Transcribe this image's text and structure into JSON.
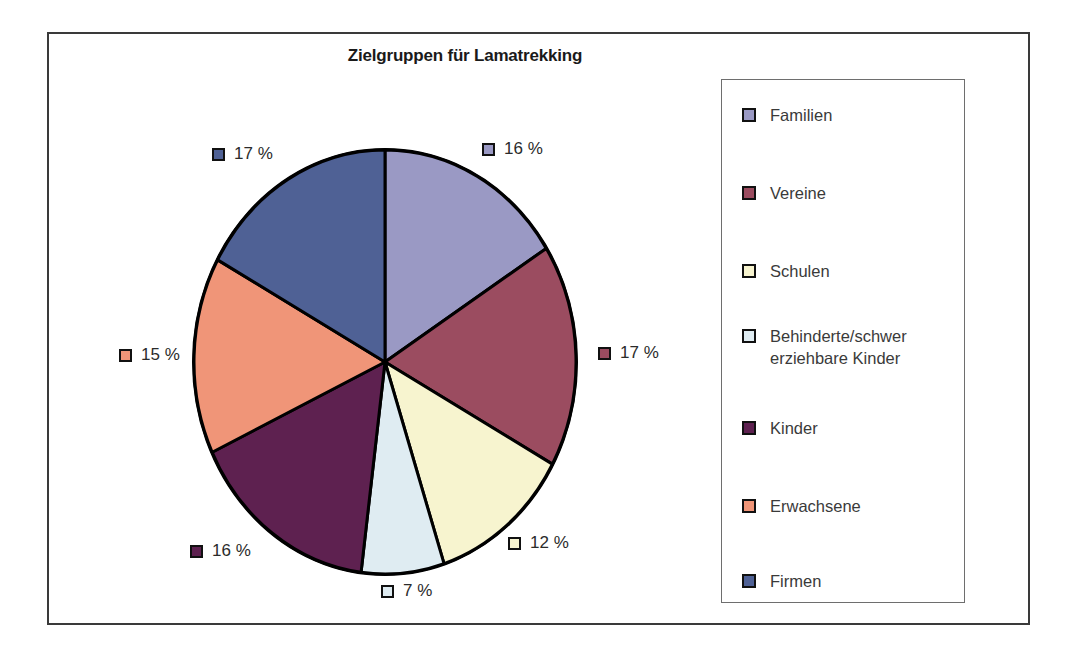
{
  "chart_data": {
    "type": "pie",
    "title": "Zielgruppen für Lamatrekking",
    "categories": [
      "Familien",
      "Vereine",
      "Schulen",
      "Behinderte/schwer erziehbare Kinder",
      "Kinder",
      "Erwachsene",
      "Firmen"
    ],
    "values": [
      16,
      17,
      12,
      7,
      16,
      15,
      17
    ],
    "value_labels": [
      "16 %",
      "17 %",
      "12 %",
      "7 %",
      "16 %",
      "15 %",
      "17 %"
    ],
    "unit": "%",
    "colors": [
      "#9a99c4",
      "#9b4c60",
      "#f7f4cf",
      "#dfecf2",
      "#5e2150",
      "#f09578",
      "#4f6195"
    ],
    "legend_position": "right",
    "start_angle_deg": 0,
    "direction": "clockwise",
    "grid": false,
    "xlabel": "",
    "ylabel": ""
  },
  "title": {
    "text": "Zielgruppen für Lamatrekking"
  },
  "legend": {
    "items": [
      {
        "label": "Familien",
        "color": "#9a99c4"
      },
      {
        "label": "Vereine",
        "color": "#9b4c60"
      },
      {
        "label": "Schulen",
        "color": "#f7f4cf"
      },
      {
        "label": "Behinderte/schwer\nerziehbare Kinder",
        "color": "#dfecf2"
      },
      {
        "label": "Kinder",
        "color": "#5e2150"
      },
      {
        "label": "Erwachsene",
        "color": "#f09578"
      },
      {
        "label": "Firmen",
        "color": "#4f6195"
      }
    ]
  },
  "pie_labels": [
    {
      "text": "16 %",
      "color": "#9a99c4"
    },
    {
      "text": "17 %",
      "color": "#9b4c60"
    },
    {
      "text": "12 %",
      "color": "#f7f4cf"
    },
    {
      "text": "7 %",
      "color": "#dfecf2"
    },
    {
      "text": "16 %",
      "color": "#5e2150"
    },
    {
      "text": "15 %",
      "color": "#f09578"
    },
    {
      "text": "17 %",
      "color": "#4f6195"
    }
  ]
}
